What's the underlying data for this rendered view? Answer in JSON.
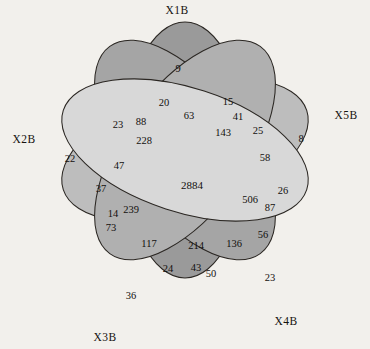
{
  "figure": {
    "type": "venn-diagram",
    "set_count": 5,
    "background_color": "#f2f0ec",
    "outline_color": "#2b2723",
    "text_color": "#120f0d"
  },
  "sets": [
    {
      "id": "X1B",
      "label": "X1B",
      "label_x": 177,
      "label_y": 14,
      "fill": "#9a9a9a",
      "opacity": 0.72,
      "cx": 185,
      "cy": 150,
      "rx": 62,
      "ry": 128,
      "rotate": 0
    },
    {
      "id": "X2B",
      "label": "X2B",
      "label_x": 24,
      "label_y": 143,
      "fill": "#bdbdbd",
      "opacity": 0.72,
      "cx": 185,
      "cy": 150,
      "rx": 62,
      "ry": 128,
      "rotate": 72
    },
    {
      "id": "X3B",
      "label": "X3B",
      "label_x": 105,
      "label_y": 341,
      "fill": "#a5a5a5",
      "opacity": 0.72,
      "cx": 185,
      "cy": 150,
      "rx": 62,
      "ry": 128,
      "rotate": 144
    },
    {
      "id": "X4B",
      "label": "X4B",
      "label_x": 286,
      "label_y": 325,
      "fill": "#b0b0b0",
      "opacity": 0.72,
      "cx": 185,
      "cy": 150,
      "rx": 62,
      "ry": 128,
      "rotate": 216
    },
    {
      "id": "X5B",
      "label": "X5B",
      "label_x": 346,
      "label_y": 119,
      "fill": "#d8d8d8",
      "opacity": 0.72,
      "cx": 185,
      "cy": 150,
      "rx": 62,
      "ry": 128,
      "rotate": 288
    }
  ],
  "chart_data": {
    "type": "venn",
    "title": "",
    "sets": [
      "X1B",
      "X2B",
      "X3B",
      "X4B",
      "X5B"
    ],
    "regions": [
      {
        "label": "9",
        "value": 9,
        "sets": [
          "X1B"
        ],
        "x": 178,
        "y": 70
      },
      {
        "label": "22",
        "value": 22,
        "sets": [
          "X2B"
        ],
        "x": 70,
        "y": 160
      },
      {
        "label": "36",
        "value": 36,
        "sets": [
          "X3B"
        ],
        "x": 131,
        "y": 297
      },
      {
        "label": "23",
        "value": 23,
        "sets": [
          "X4B"
        ],
        "x": 270,
        "y": 279
      },
      {
        "label": "8",
        "value": 8,
        "sets": [
          "X5B"
        ],
        "x": 301,
        "y": 140
      },
      {
        "label": "20",
        "value": 20,
        "sets": [
          "X1B",
          "X2B"
        ],
        "x": 164,
        "y": 104
      },
      {
        "label": "15",
        "value": 15,
        "sets": [
          "X1B",
          "X5B"
        ],
        "x": 228,
        "y": 103
      },
      {
        "label": "23",
        "value": 23,
        "sets": [
          "X2B",
          "X1B"
        ],
        "x": 118,
        "y": 126
      },
      {
        "label": "88",
        "value": 88,
        "sets": [
          "X1B",
          "X2B",
          "X3B"
        ],
        "x": 141,
        "y": 123
      },
      {
        "label": "63",
        "value": 63,
        "sets": [
          "X1B",
          "X5B"
        ],
        "x": 189,
        "y": 117
      },
      {
        "label": "41",
        "value": 41,
        "sets": [
          "X1B",
          "X4B",
          "X5B"
        ],
        "x": 238,
        "y": 118
      },
      {
        "label": "25",
        "value": 25,
        "sets": [
          "X5B",
          "X4B"
        ],
        "x": 258,
        "y": 132
      },
      {
        "label": "228",
        "value": 228,
        "sets": [
          "X1B",
          "X2B",
          "X3B"
        ],
        "x": 144,
        "y": 142
      },
      {
        "label": "143",
        "value": 143,
        "sets": [
          "X1B",
          "X4B",
          "X5B"
        ],
        "x": 223,
        "y": 134
      },
      {
        "label": "58",
        "value": 58,
        "sets": [
          "X4B",
          "X5B"
        ],
        "x": 265,
        "y": 159
      },
      {
        "label": "47",
        "value": 47,
        "sets": [
          "X2B",
          "X3B"
        ],
        "x": 119,
        "y": 167
      },
      {
        "label": "37",
        "value": 37,
        "sets": [
          "X2B"
        ],
        "x": 101,
        "y": 190
      },
      {
        "label": "2884",
        "value": 2884,
        "sets": [
          "X1B",
          "X2B",
          "X3B",
          "X4B",
          "X5B"
        ],
        "x": 192,
        "y": 186
      },
      {
        "label": "506",
        "value": 506,
        "sets": [
          "X1B",
          "X4B",
          "X5B"
        ],
        "x": 250,
        "y": 201
      },
      {
        "label": "26",
        "value": 26,
        "sets": [
          "X5B"
        ],
        "x": 283,
        "y": 192
      },
      {
        "label": "87",
        "value": 87,
        "sets": [
          "X4B",
          "X5B"
        ],
        "x": 270,
        "y": 209
      },
      {
        "label": "14",
        "value": 14,
        "sets": [
          "X2B",
          "X3B"
        ],
        "x": 113,
        "y": 215
      },
      {
        "label": "239",
        "value": 239,
        "sets": [
          "X2B",
          "X3B"
        ],
        "x": 131,
        "y": 211
      },
      {
        "label": "73",
        "value": 73,
        "sets": [
          "X2B",
          "X3B"
        ],
        "x": 111,
        "y": 229
      },
      {
        "label": "117",
        "value": 117,
        "sets": [
          "X2B",
          "X3B",
          "X4B"
        ],
        "x": 149,
        "y": 245
      },
      {
        "label": "214",
        "value": 214,
        "sets": [
          "X1B",
          "X2B",
          "X3B",
          "X4B"
        ],
        "x": 196,
        "y": 247
      },
      {
        "label": "136",
        "value": 136,
        "sets": [
          "X3B",
          "X4B",
          "X5B"
        ],
        "x": 234,
        "y": 245
      },
      {
        "label": "56",
        "value": 56,
        "sets": [
          "X4B",
          "X5B"
        ],
        "x": 263,
        "y": 236
      },
      {
        "label": "24",
        "value": 24,
        "sets": [
          "X3B"
        ],
        "x": 168,
        "y": 270
      },
      {
        "label": "43",
        "value": 43,
        "sets": [
          "X3B",
          "X4B"
        ],
        "x": 196,
        "y": 269
      },
      {
        "label": "50",
        "value": 50,
        "sets": [
          "X3B",
          "X4B"
        ],
        "x": 211,
        "y": 275
      }
    ]
  }
}
